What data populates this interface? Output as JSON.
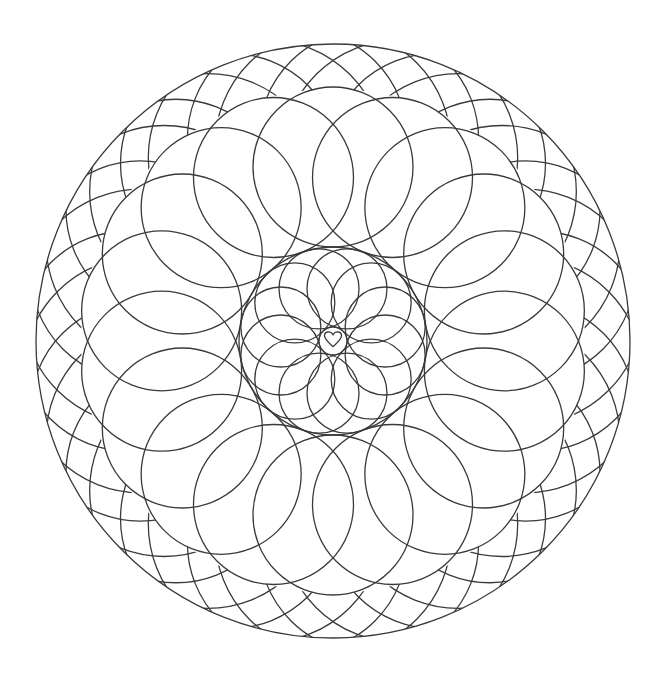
{
  "image": {
    "type": "mandala line art",
    "width": 670,
    "height": 675,
    "background": "#ffffff",
    "stroke_color": "#3a3a3a",
    "stroke_width": 1.3
  },
  "mandala": {
    "center": [
      333,
      341
    ],
    "outer_circle_radius": 297,
    "braid_band": {
      "inner_radius": 252,
      "outer_radius": 297,
      "ring_a": {
        "count": 18,
        "circle_radius": 110,
        "distance": 205,
        "angle_offset_deg": 10
      },
      "ring_b": {
        "count": 18,
        "circle_radius": 118,
        "distance": 195,
        "angle_offset_deg": 0
      }
    },
    "middle_ring": {
      "count": 18,
      "circle_radius": 80,
      "distance": 174,
      "angle_offset_deg": 0
    },
    "inner_boundary_radius": 94,
    "inner_rosette": {
      "count": 12,
      "circle_radius": 40,
      "distance": 54,
      "angle_offset_deg": 15
    },
    "center_circle_radius": 14,
    "center_icon": "heart-icon"
  }
}
